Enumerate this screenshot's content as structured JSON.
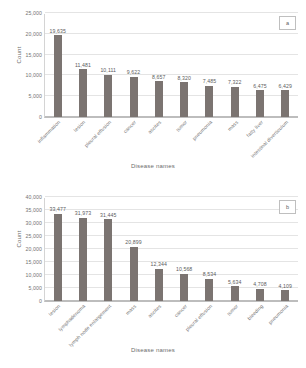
{
  "figure": {
    "background": "#ffffff",
    "bar_color": "#7b7471",
    "grid_color": "#e4e4e4",
    "axis_color": "#bdbdbd"
  },
  "chart_data": [
    {
      "type": "bar",
      "panel": "a",
      "title": "",
      "xlabel": "Disease names",
      "ylabel": "Count",
      "ylim": [
        0,
        25000
      ],
      "yticks": [
        0,
        5000,
        10000,
        15000,
        20000,
        25000
      ],
      "ytick_labels": [
        "0",
        "5,000",
        "10,000",
        "15,000",
        "20,000",
        "25,000"
      ],
      "grid": true,
      "legend": "none",
      "categories": [
        "inflammation",
        "lesion",
        "pleural effusion",
        "cancer",
        "ascites",
        "tumor",
        "pneumonia",
        "mass",
        "fatty liver",
        "intestinal diverticulum"
      ],
      "values": [
        19635,
        11481,
        10111,
        9622,
        8657,
        8320,
        7485,
        7322,
        6475,
        6429
      ],
      "value_labels": [
        "19,635",
        "11,481",
        "10,111",
        "9,622",
        "8,657",
        "8,320",
        "7,485",
        "7,322",
        "6,475",
        "6,429"
      ]
    },
    {
      "type": "bar",
      "panel": "b",
      "title": "",
      "xlabel": "Disease names",
      "ylabel": "Count",
      "ylim": [
        0,
        40000
      ],
      "yticks": [
        0,
        5000,
        10000,
        15000,
        20000,
        25000,
        30000,
        35000,
        40000
      ],
      "ytick_labels": [
        "0",
        "5,000",
        "10,000",
        "15,000",
        "20,000",
        "25,000",
        "30,000",
        "35,000",
        "40,000"
      ],
      "grid": true,
      "legend": "none",
      "categories": [
        "lesion",
        "lymphadenoma",
        "lymph node enlargement",
        "mass",
        "ascites",
        "cancer",
        "pleural effusion",
        "tumor",
        "bleeding",
        "pneumonia"
      ],
      "values": [
        33477,
        31973,
        31445,
        20899,
        12344,
        10568,
        8534,
        5634,
        4708,
        4109
      ],
      "value_labels": [
        "33,477",
        "31,973",
        "31,445",
        "20,899",
        "12,344",
        "10,568",
        "8,534",
        "5,634",
        "4,708",
        "4,109"
      ]
    }
  ]
}
